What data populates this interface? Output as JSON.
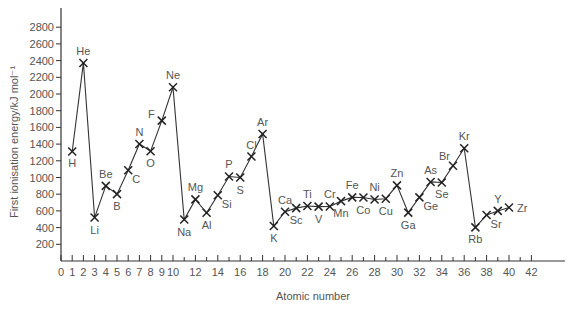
{
  "chart_data": {
    "type": "line",
    "title": "",
    "xlabel": "Atomic number",
    "ylabel": "First ionisation energy/kJ mol⁻¹",
    "xlim": [
      0,
      43.5
    ],
    "ylim": [
      0,
      3000
    ],
    "grid": false,
    "legend": null,
    "x_ticks_labeled": [
      0,
      1,
      2,
      3,
      4,
      5,
      6,
      7,
      8,
      9,
      10,
      12,
      14,
      16,
      18,
      20,
      22,
      24,
      26,
      28,
      30,
      32,
      34,
      36,
      38,
      40,
      42
    ],
    "x_ticks_minor": [
      11,
      13,
      15,
      17,
      19,
      21,
      23,
      25,
      27,
      29,
      31,
      33,
      35,
      37,
      39,
      41
    ],
    "y_ticks": [
      200,
      400,
      600,
      800,
      1000,
      1200,
      1400,
      1600,
      1800,
      2000,
      2200,
      2400,
      2600,
      2800
    ],
    "marker": "x",
    "series": [
      {
        "name": "First ionisation energy",
        "points": [
          {
            "x": 1,
            "y": 1312,
            "label": "H",
            "pos": "below"
          },
          {
            "x": 2,
            "y": 2372,
            "label": "He",
            "pos": "above"
          },
          {
            "x": 3,
            "y": 520,
            "label": "Li",
            "pos": "below"
          },
          {
            "x": 4,
            "y": 900,
            "label": "Be",
            "pos": "above"
          },
          {
            "x": 5,
            "y": 801,
            "label": "B",
            "pos": "below"
          },
          {
            "x": 6,
            "y": 1086,
            "label": "C",
            "pos": "right-below"
          },
          {
            "x": 7,
            "y": 1402,
            "label": "N",
            "pos": "above"
          },
          {
            "x": 8,
            "y": 1314,
            "label": "O",
            "pos": "below"
          },
          {
            "x": 9,
            "y": 1681,
            "label": "F",
            "pos": "left"
          },
          {
            "x": 10,
            "y": 2081,
            "label": "Ne",
            "pos": "above"
          },
          {
            "x": 11,
            "y": 496,
            "label": "Na",
            "pos": "below"
          },
          {
            "x": 12,
            "y": 738,
            "label": "Mg",
            "pos": "above"
          },
          {
            "x": 13,
            "y": 578,
            "label": "Al",
            "pos": "below"
          },
          {
            "x": 14,
            "y": 787,
            "label": "Si",
            "pos": "right-below"
          },
          {
            "x": 15,
            "y": 1012,
            "label": "P",
            "pos": "above"
          },
          {
            "x": 16,
            "y": 1000,
            "label": "S",
            "pos": "below"
          },
          {
            "x": 17,
            "y": 1251,
            "label": "Cl",
            "pos": "above"
          },
          {
            "x": 18,
            "y": 1521,
            "label": "Ar",
            "pos": "above"
          },
          {
            "x": 19,
            "y": 419,
            "label": "K",
            "pos": "below"
          },
          {
            "x": 20,
            "y": 590,
            "label": "Ca",
            "pos": "above"
          },
          {
            "x": 21,
            "y": 633,
            "label": "Sc",
            "pos": "below"
          },
          {
            "x": 22,
            "y": 659,
            "label": "Ti",
            "pos": "above"
          },
          {
            "x": 23,
            "y": 651,
            "label": "V",
            "pos": "below"
          },
          {
            "x": 24,
            "y": 653,
            "label": "Cr",
            "pos": "above"
          },
          {
            "x": 25,
            "y": 717,
            "label": "Mn",
            "pos": "below"
          },
          {
            "x": 26,
            "y": 762,
            "label": "Fe",
            "pos": "above"
          },
          {
            "x": 27,
            "y": 760,
            "label": "Co",
            "pos": "below"
          },
          {
            "x": 28,
            "y": 737,
            "label": "Ni",
            "pos": "above"
          },
          {
            "x": 29,
            "y": 746,
            "label": "Cu",
            "pos": "below"
          },
          {
            "x": 30,
            "y": 906,
            "label": "Zn",
            "pos": "above"
          },
          {
            "x": 31,
            "y": 579,
            "label": "Ga",
            "pos": "below"
          },
          {
            "x": 32,
            "y": 762,
            "label": "Ge",
            "pos": "right-below"
          },
          {
            "x": 33,
            "y": 947,
            "label": "As",
            "pos": "above"
          },
          {
            "x": 34,
            "y": 941,
            "label": "Se",
            "pos": "below"
          },
          {
            "x": 35,
            "y": 1140,
            "label": "Br",
            "pos": "left-above"
          },
          {
            "x": 36,
            "y": 1351,
            "label": "Kr",
            "pos": "above"
          },
          {
            "x": 37,
            "y": 403,
            "label": "Rb",
            "pos": "below"
          },
          {
            "x": 38,
            "y": 550,
            "label": "Sr",
            "pos": "right-below"
          },
          {
            "x": 39,
            "y": 600,
            "label": "Y",
            "pos": "above"
          },
          {
            "x": 40,
            "y": 640,
            "label": "Zr",
            "pos": "right"
          }
        ]
      }
    ]
  },
  "layout": {
    "origin_px": [
      61,
      261
    ],
    "x_px_per_unit": 11.2,
    "y_px_per_100": 8.35,
    "x_axis_end_px": 565,
    "y_axis_top_px": 8,
    "line_color": "#333333",
    "text_color": "#555555"
  }
}
